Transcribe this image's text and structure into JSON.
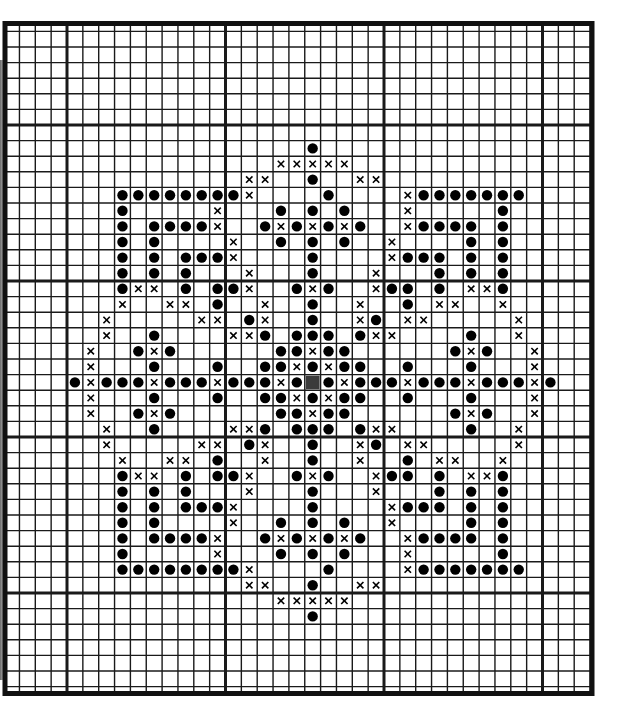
{
  "chart": {
    "title": "Cross-stitch pattern chart",
    "type": "stitch-grid",
    "legend": {
      "o": "filled dot stitch",
      "x": "cross stitch",
      "g": "center marker (gray square)"
    },
    "colors": {
      "grid_line": "#1a1a1a",
      "symbol": "#000000",
      "center_marker": "#3a3a3a",
      "background": "#ffffff"
    },
    "grid": {
      "columns": 37,
      "rows": 44,
      "major_every": 10,
      "major_col_offset": 4,
      "major_row_offset": 7,
      "center_cell": {
        "col": 19,
        "row": 23
      }
    },
    "rows": [
      ".....................................",
      ".....................................",
      ".....................................",
      ".....................................",
      ".....................................",
      ".....................................",
      ".....................................",
      ".....................................",
      "...................o.................",
      ".................xxxxx...............",
      "...............xx..o..xx.............",
      ".......oooooooox....o....xooooooo.....",
      ".......o.....x...o.o.o...x.....o.....",
      ".......o.oooox..oxoxoxo..xoooo.o.....",
      ".......o.o....x..o.o.o..x....o.o.....",
      ".......o.o.ooox....o....xooo.o.o.....",
      ".......o.o.o...x...o...x...o.o.o.....",
      ".......oxx.o.oox..oxo..xoo.o.xxo.....",
      ".......x..xx.o..x..o..x..o.xx..x.....",
      "......x.....xx.ox..o..xo.xx.....x....",
      "......x..o....xxo.ooo.oxx....o..x....",
      ".....x..oxo......ooxoo......oxo..x...",
      ".....x...o...o..ooxoxoo..o...o...x...",
      "....oxoooxoooxoooxogoxoooxoooxoooxo..",
      ".....x...o...o..ooxoxoo..o...o...x...",
      ".....x..oxo......ooxoo......oxo..x...",
      "......x..o....xxo.ooo.oxx....o..x....",
      "......x.....xx.ox..o..xo.xx.....x....",
      ".......x..xx.o..x..o..x..o.xx..x.....",
      ".......oxx.o.oox..oxo..xoo.o.xxo.....",
      ".......o.o.o...x...o...x...o.o.o.....",
      ".......o.o.ooox....o....xooo.o.o.....",
      ".......o.o....x..o.o.o..x....o.o.....",
      ".......o.oooox..oxoxoxo..xoooo.o.....",
      ".......o.....x...o.o.o...x.....o.....",
      ".......oooooooox....o....xooooooo.....",
      "...............xx..o..xx.............",
      ".................xxxxx...............",
      "...................o.................",
      ".....................................",
      ".....................................",
      ".....................................",
      ".....................................",
      "....................................."
    ]
  }
}
